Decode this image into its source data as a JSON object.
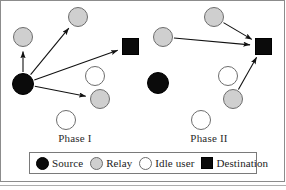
{
  "figure": {
    "colors": {
      "source": "#0b0b0b",
      "relay": "#cfcfcf",
      "idle": "#ffffff",
      "destination": "#0b0b0b",
      "node_outline": "#6d6d6d",
      "arrow": "#111111",
      "frame": "#8c8c8c"
    }
  },
  "phases": [
    {
      "id": "phase-1",
      "label": "Phase I",
      "label_x": 75,
      "label_y": 132,
      "nodes": [
        {
          "name": "source",
          "type": "source",
          "x": 23,
          "y": 84,
          "r": 11
        },
        {
          "name": "relay-upper-left",
          "type": "relay",
          "x": 23,
          "y": 37,
          "r": 10
        },
        {
          "name": "relay-top",
          "type": "relay",
          "x": 78,
          "y": 17,
          "r": 10
        },
        {
          "name": "relay-lower",
          "type": "relay",
          "x": 100,
          "y": 99,
          "r": 10
        },
        {
          "name": "idle-middle",
          "type": "idle",
          "x": 95,
          "y": 76,
          "r": 10
        },
        {
          "name": "idle-bottom",
          "type": "idle",
          "x": 66,
          "y": 120,
          "r": 10
        },
        {
          "name": "destination",
          "type": "dest",
          "x": 130,
          "y": 46,
          "s": 17
        }
      ],
      "edges": [
        {
          "from": "source",
          "to": "relay-upper-left"
        },
        {
          "from": "source",
          "to": "relay-top"
        },
        {
          "from": "source",
          "to": "relay-lower"
        },
        {
          "from": "source",
          "to": "destination"
        }
      ]
    },
    {
      "id": "phase-2",
      "label": "Phase II",
      "label_x": 209,
      "label_y": 132,
      "nodes": [
        {
          "name": "source",
          "type": "source",
          "x": 158,
          "y": 83,
          "r": 11
        },
        {
          "name": "relay-left",
          "type": "relay",
          "x": 163,
          "y": 37,
          "r": 10
        },
        {
          "name": "relay-top",
          "type": "relay",
          "x": 214,
          "y": 17,
          "r": 10
        },
        {
          "name": "relay-lower",
          "type": "relay",
          "x": 233,
          "y": 99,
          "r": 10
        },
        {
          "name": "idle-middle",
          "type": "idle",
          "x": 228,
          "y": 76,
          "r": 10
        },
        {
          "name": "idle-bottom",
          "type": "idle",
          "x": 201,
          "y": 120,
          "r": 10
        },
        {
          "name": "destination",
          "type": "dest",
          "x": 263,
          "y": 46,
          "s": 17
        }
      ],
      "edges": [
        {
          "from": "relay-left",
          "to": "destination"
        },
        {
          "from": "relay-top",
          "to": "destination"
        },
        {
          "from": "relay-lower",
          "to": "destination"
        }
      ]
    }
  ],
  "legend": {
    "items": [
      {
        "key": "source",
        "label": "Source",
        "shape": "circle",
        "fill": "#0b0b0b"
      },
      {
        "key": "relay",
        "label": "Relay",
        "shape": "circle",
        "fill": "#cfcfcf"
      },
      {
        "key": "idle",
        "label": "Idle user",
        "shape": "circle",
        "fill": "#ffffff"
      },
      {
        "key": "destination",
        "label": "Destination",
        "shape": "square",
        "fill": "#0b0b0b"
      }
    ]
  }
}
